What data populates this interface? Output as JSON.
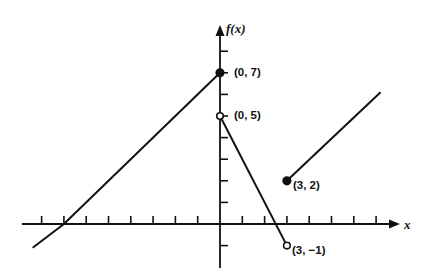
{
  "chart_data": {
    "type": "line",
    "title": "",
    "xlabel": "x",
    "ylabel": "f(x)",
    "xlim": [
      -8.5,
      8.5
    ],
    "ylim": [
      -2.2,
      8.5
    ],
    "grid": false,
    "x_ticks": [
      -8,
      -7,
      -6,
      -5,
      -4,
      -3,
      -2,
      -1,
      1,
      2,
      3,
      4,
      5,
      6,
      7
    ],
    "y_ticks": [
      -1,
      1,
      2,
      3,
      4,
      5,
      6,
      7,
      8
    ],
    "series": [
      {
        "name": "segment-1",
        "points": [
          [
            -8.4,
            -1.1
          ],
          [
            -7,
            0
          ],
          [
            0,
            7
          ]
        ],
        "left_end": "continues",
        "right_end": "closed"
      },
      {
        "name": "segment-2",
        "points": [
          [
            0,
            5
          ],
          [
            3,
            -1
          ]
        ],
        "left_end": "open",
        "right_end": "open"
      },
      {
        "name": "segment-3",
        "points": [
          [
            3,
            2
          ],
          [
            7.2,
            6.1
          ]
        ],
        "left_end": "closed",
        "right_end": "continues"
      }
    ],
    "annotations": [
      {
        "text": "(0, 7)",
        "x": 0,
        "y": 7,
        "marker": "closed"
      },
      {
        "text": "(0, 5)",
        "x": 0,
        "y": 5,
        "marker": "open"
      },
      {
        "text": "(3, 2)",
        "x": 3,
        "y": 2,
        "marker": "closed"
      },
      {
        "text": "(3, −1)",
        "x": 3,
        "y": -1,
        "marker": "open"
      }
    ]
  },
  "labels": {
    "y_axis": "f(x)",
    "x_axis": "x",
    "p07": "(0, 7)",
    "p05": "(0, 5)",
    "p32": "(3, 2)",
    "p3m1": "(3, −1)"
  }
}
